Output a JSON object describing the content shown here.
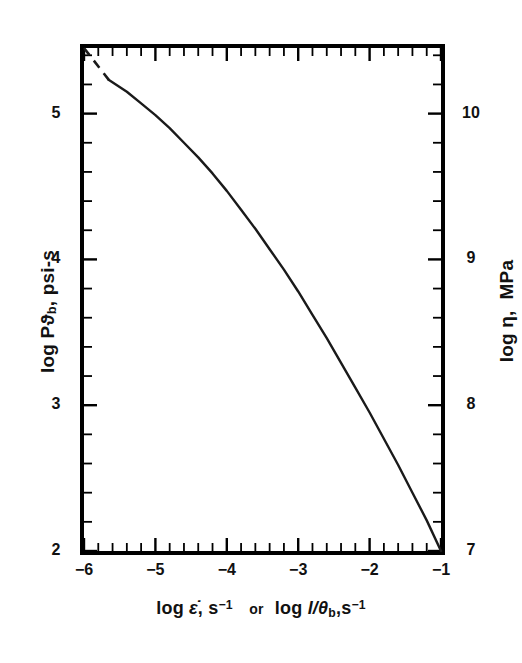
{
  "figure": {
    "background_color": "#ffffff",
    "line_color": "#1a1a1a",
    "axis_color": "#000000"
  },
  "axes": {
    "x": {
      "title_parts": {
        "log1": "log",
        "var1": "ε̇",
        "comma1": ",",
        "unit1": "s",
        "exp1": "−1",
        "or": "or",
        "log2": "log",
        "var2": "l/θ",
        "sub2": "b",
        "comma2": ",",
        "unit2": "s",
        "exp2": "−1"
      },
      "title_plain": "log ε̇, s−1 or log l/θb, s−1",
      "tick_labels": [
        "−6",
        "−5",
        "−4",
        "−3",
        "−2",
        "−1"
      ],
      "tick_values": [
        -6,
        -5,
        -4,
        -3,
        -2,
        -1
      ],
      "range": [
        -6,
        -1
      ],
      "minor_ticks_per_interval": 5
    },
    "y_left": {
      "title_parts": {
        "log": "log",
        "var": "Pϑ",
        "sub": "b",
        "comma": ",",
        "unit": "psi-s"
      },
      "title_plain": "log Pϑb, psi-s",
      "tick_labels": [
        "5",
        "4",
        "3",
        "2"
      ],
      "tick_values": [
        5,
        4,
        3,
        2
      ],
      "range": [
        2.0,
        5.45
      ],
      "minor_ticks_per_interval": 5
    },
    "y_right": {
      "title_parts": {
        "log": "log",
        "var": "η",
        "comma": ",",
        "unit": "MPa"
      },
      "title_plain": "log η, MPa",
      "tick_labels": [
        "10",
        "9",
        "8",
        "7"
      ],
      "tick_values": [
        10,
        9,
        8,
        7
      ],
      "range": [
        7.0,
        10.45
      ],
      "minor_ticks_per_interval": 5
    }
  },
  "chart_data": {
    "type": "line",
    "title": "",
    "subtitle": "",
    "xlabel": "log ε̇, s−1 or log l/θb, s−1",
    "ylabel": "log Pϑb, psi-s",
    "ylabel_secondary": "log η, MPa",
    "xlim": [
      -6,
      -1
    ],
    "ylim": [
      2.0,
      5.45
    ],
    "ylim_secondary": [
      7.0,
      10.45
    ],
    "grid": false,
    "legend": false,
    "series": [
      {
        "name": "extrapolated",
        "style": "dashed",
        "x": [
          -6.0,
          -5.65
        ],
        "y": [
          5.45,
          5.23
        ]
      },
      {
        "name": "Pϑb vs strain rate",
        "style": "solid",
        "x": [
          -5.65,
          -5.4,
          -5.2,
          -5.0,
          -4.8,
          -4.6,
          -4.4,
          -4.2,
          -4.0,
          -3.8,
          -3.6,
          -3.4,
          -3.2,
          -3.0,
          -2.8,
          -2.6,
          -2.4,
          -2.2,
          -2.0,
          -1.8,
          -1.6,
          -1.4,
          -1.2,
          -1.0
        ],
        "y": [
          5.23,
          5.15,
          5.07,
          4.99,
          4.9,
          4.8,
          4.7,
          4.59,
          4.47,
          4.34,
          4.21,
          4.07,
          3.93,
          3.78,
          3.62,
          3.46,
          3.29,
          3.12,
          2.95,
          2.77,
          2.59,
          2.4,
          2.21,
          2.0
        ]
      }
    ]
  }
}
